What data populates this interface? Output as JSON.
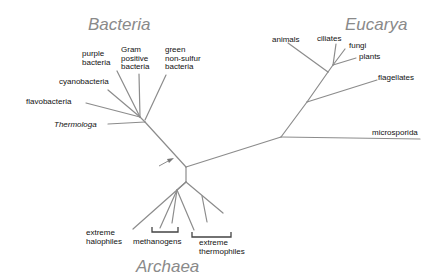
{
  "diagram": {
    "type": "phylogenetic-tree",
    "colors": {
      "branch": "#8c8c8c",
      "bracket": "#444444",
      "domain_label": "#8a8a8a",
      "leaf_label": "#111111"
    },
    "domains": {
      "bacteria": {
        "label": "Bacteria"
      },
      "eucarya": {
        "label": "Eucarya"
      },
      "archaea": {
        "label": "Archaea"
      }
    },
    "leaves": {
      "purple_bacteria": "purple\nbacteria",
      "gram_positive": "Gram\npositive\nbacteria",
      "green_nonsulfur": "green\nnon-sulfur\nbacteria",
      "cyanobacteria": "cyanobacteria",
      "flavobacteria": "flavobacteria",
      "thermotoga": "Thermologa",
      "animals": "animals",
      "ciliates": "ciliates",
      "fungi": "fungi",
      "plants": "plants",
      "flagellates": "flagellates",
      "microsporida": "microsporida",
      "extreme_halophiles": "extreme\nhalophiles",
      "methanogens": "methanogens",
      "extreme_thermophiles": "extreme\nthermophiles"
    },
    "root_marker": "arrow-icon"
  }
}
